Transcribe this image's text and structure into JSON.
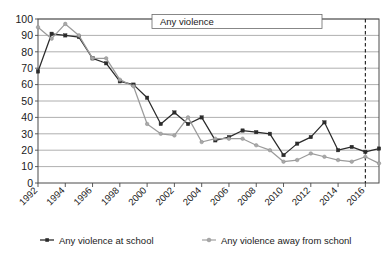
{
  "chart_data": {
    "type": "line",
    "title": "Any violence",
    "xlabel": "",
    "ylabel": "",
    "ylim": [
      0,
      100
    ],
    "ytick_values": [
      0,
      10,
      20,
      30,
      40,
      50,
      60,
      70,
      80,
      90,
      100
    ],
    "xtick_labels": [
      "1992",
      "1994",
      "1996",
      "1998",
      "2000",
      "2002",
      "2004",
      "2006",
      "2008",
      "2010",
      "2012",
      "2014",
      "2016"
    ],
    "x": [
      1992,
      1993,
      1994,
      1995,
      1996,
      1997,
      1998,
      1999,
      2000,
      2001,
      2002,
      2003,
      2004,
      2005,
      2006,
      2007,
      2008,
      2009,
      2010,
      2011,
      2012,
      2013,
      2014,
      2015,
      2016,
      2017
    ],
    "grid": true,
    "legend_position": "bottom",
    "annotations": [
      {
        "name": "break-in-series",
        "type": "vertical-dashed-line",
        "x": 2016
      }
    ],
    "series": [
      {
        "name": "Any violence at school",
        "color": "#2b2b2b",
        "marker": "square",
        "values": [
          68,
          91,
          90,
          89,
          76,
          73,
          62,
          60,
          52,
          36,
          43,
          36,
          40,
          26,
          28,
          32,
          31,
          30,
          17,
          24,
          28,
          37,
          20,
          22,
          19,
          21
        ]
      },
      {
        "name": "Any violence away from schonl",
        "color": "#a8a8a8",
        "marker": "circle",
        "values": [
          95,
          88,
          97,
          90,
          76,
          76,
          63,
          59,
          36,
          30,
          29,
          40,
          25,
          27,
          27,
          27,
          23,
          20,
          13,
          14,
          18,
          16,
          14,
          13,
          16,
          12
        ]
      }
    ]
  },
  "legend": {
    "items": [
      {
        "label": "Any violence at school",
        "color": "#2b2b2b"
      },
      {
        "label": "Any violence away from schonl",
        "color": "#a8a8a8"
      }
    ]
  }
}
